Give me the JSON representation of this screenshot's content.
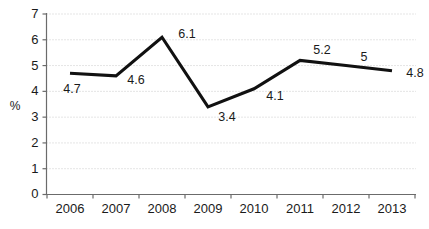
{
  "chart_data": {
    "type": "line",
    "title": "",
    "subtitle": "",
    "xlabel": "",
    "ylabel": "%",
    "categories": [
      "2006",
      "2007",
      "2008",
      "2009",
      "2010",
      "2011",
      "2012",
      "2013"
    ],
    "values": [
      4.7,
      4.6,
      6.1,
      3.4,
      4.1,
      5.2,
      5,
      4.8
    ],
    "point_labels": [
      "4.7",
      "4.6",
      "6.1",
      "3.4",
      "4.1",
      "5.2",
      "5",
      "4.8"
    ],
    "series": [
      {
        "name": "",
        "values": [
          4.7,
          4.6,
          6.1,
          3.4,
          4.1,
          5.2,
          5,
          4.8
        ]
      }
    ],
    "ylim": [
      0,
      7
    ],
    "ytick_labels": [
      "0",
      "1",
      "2",
      "3",
      "4",
      "5",
      "6",
      "7"
    ],
    "ytick_values": [
      0,
      1,
      2,
      3,
      4,
      5,
      6,
      7
    ],
    "grid": true,
    "grid_axis": "y",
    "legend": false,
    "legend_position": "none",
    "line_color": "#111111",
    "grid_color": "#c9c9c9",
    "axis_color": "#6b6b6b",
    "background_color": "#ffffff"
  }
}
